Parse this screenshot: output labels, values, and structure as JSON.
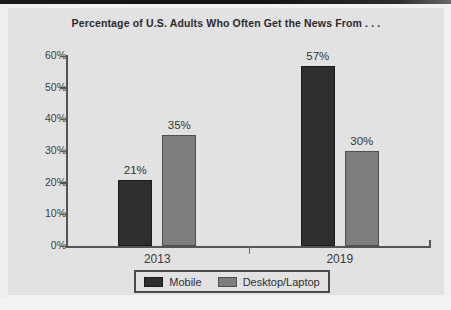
{
  "chart_data": {
    "type": "bar",
    "title": "Percentage of U.S. Adults Who Often Get the News From . . .",
    "xlabel": "",
    "ylabel": "",
    "ylim": [
      0,
      60
    ],
    "grid": false,
    "legend_position": "bottom-center",
    "categories": [
      "2013",
      "2019"
    ],
    "ytick_labels": [
      "0%",
      "10%",
      "20%",
      "30%",
      "40%",
      "50%",
      "60%"
    ],
    "ytick_values": [
      0,
      10,
      20,
      30,
      40,
      50,
      60
    ],
    "series": [
      {
        "name": "Mobile",
        "color": "#2f2f2f",
        "values": [
          21,
          57
        ],
        "data_labels": [
          "21%",
          "57%"
        ]
      },
      {
        "name": "Desktop/Laptop",
        "color": "#7e7e7e",
        "values": [
          35,
          30
        ],
        "data_labels": [
          "35%",
          "30%"
        ]
      }
    ]
  },
  "legend": {
    "entries": [
      {
        "label": "Mobile",
        "color": "#2f2f2f"
      },
      {
        "label": "Desktop/Laptop",
        "color": "#7e7e7e"
      }
    ]
  },
  "colors": {
    "mobile": "#2f2f2f",
    "desktop": "#7e7e7e",
    "background": "#e3e3e3",
    "axis": "#555555",
    "text": "#2b2b2b"
  }
}
